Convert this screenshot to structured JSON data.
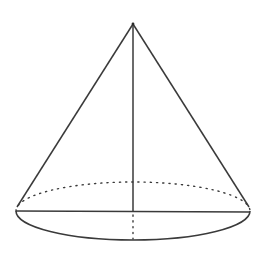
{
  "diagram": {
    "type": "geometry",
    "shape": "right circular cone",
    "background": "#ffffff",
    "stroke_color": "#3a3a3a",
    "apex": {
      "x": 133,
      "y": 24
    },
    "base_center": {
      "x": 133,
      "y": 211
    },
    "base_ellipse": {
      "cx": 133,
      "cy": 211,
      "rx": 117,
      "ry": 29
    },
    "elements": [
      {
        "name": "left-slant-edge",
        "style": "solid"
      },
      {
        "name": "right-slant-edge",
        "style": "solid"
      },
      {
        "name": "height-line",
        "style": "solid"
      },
      {
        "name": "base-diameter",
        "style": "solid"
      },
      {
        "name": "base-front-arc",
        "style": "solid"
      },
      {
        "name": "base-back-arc",
        "style": "dotted"
      },
      {
        "name": "hidden-radius-segment",
        "style": "dotted"
      }
    ],
    "labels": []
  }
}
